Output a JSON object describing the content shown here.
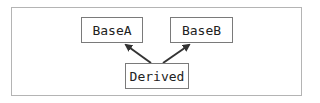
{
  "diagram": {
    "type": "class-inheritance",
    "nodes": [
      {
        "id": "baseA",
        "label": "BaseA"
      },
      {
        "id": "baseB",
        "label": "BaseB"
      },
      {
        "id": "derived",
        "label": "Derived"
      }
    ],
    "edges": [
      {
        "from": "derived",
        "to": "baseA",
        "style": "arrow"
      },
      {
        "from": "derived",
        "to": "baseB",
        "style": "arrow"
      }
    ],
    "colors": {
      "frame_border": "#b4b4b4",
      "node_border": "#7a7a7a",
      "arrow": "#333333",
      "text": "#222222"
    }
  }
}
